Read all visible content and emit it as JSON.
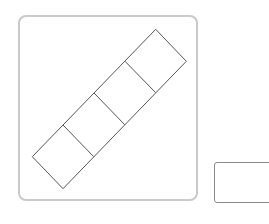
{
  "figure": {
    "square_count": 4,
    "stroke_color": "#555555",
    "frame_border_color": "#cacaca"
  },
  "answer_box": {
    "value": "",
    "border_color": "#8a8a8a"
  }
}
